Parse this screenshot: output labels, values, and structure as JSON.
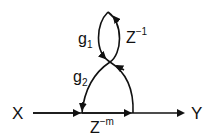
{
  "diagram": {
    "type": "signal-flow-graph",
    "nodes": {
      "input": "X",
      "output": "Y"
    },
    "branches": {
      "forward": {
        "label": "Z",
        "exponent": "−m"
      },
      "g1": {
        "label": "g",
        "subscript": "1"
      },
      "z_inv": {
        "label": "Z",
        "exponent": "−1"
      },
      "g2": {
        "label": "g",
        "subscript": "2"
      }
    },
    "colors": {
      "stroke": "#111111",
      "background": "#ffffff"
    }
  }
}
